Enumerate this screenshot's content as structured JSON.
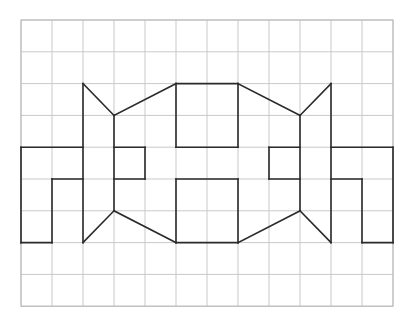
{
  "diagram": {
    "type": "grid-figure",
    "grid": {
      "columns": 12,
      "rows": 9,
      "origin_px": [
        21,
        20
      ],
      "cell_px": [
        31,
        31.8
      ],
      "line_color": "#c9c9c9"
    },
    "figure": {
      "stroke_color": "#2a2a2a",
      "segments": [
        [
          [
            0,
            4
          ],
          [
            2,
            4
          ]
        ],
        [
          [
            0,
            4
          ],
          [
            0,
            7
          ]
        ],
        [
          [
            0,
            7
          ],
          [
            1,
            7
          ]
        ],
        [
          [
            1,
            7
          ],
          [
            1,
            5
          ]
        ],
        [
          [
            1,
            5
          ],
          [
            2,
            5
          ]
        ],
        [
          [
            2,
            2
          ],
          [
            2,
            7
          ]
        ],
        [
          [
            2,
            2
          ],
          [
            3,
            3
          ]
        ],
        [
          [
            3,
            3
          ],
          [
            3,
            6
          ]
        ],
        [
          [
            3,
            6
          ],
          [
            2,
            7
          ]
        ],
        [
          [
            3,
            4
          ],
          [
            4,
            4
          ]
        ],
        [
          [
            4,
            4
          ],
          [
            4,
            5
          ]
        ],
        [
          [
            4,
            5
          ],
          [
            3,
            5
          ]
        ],
        [
          [
            3,
            3
          ],
          [
            5,
            2
          ]
        ],
        [
          [
            5,
            2
          ],
          [
            7,
            2
          ]
        ],
        [
          [
            7,
            2
          ],
          [
            9,
            3
          ]
        ],
        [
          [
            5,
            2
          ],
          [
            5,
            4
          ]
        ],
        [
          [
            5,
            4
          ],
          [
            7,
            4
          ]
        ],
        [
          [
            7,
            4
          ],
          [
            7,
            2
          ]
        ],
        [
          [
            3,
            6
          ],
          [
            5,
            7
          ]
        ],
        [
          [
            5,
            7
          ],
          [
            7,
            7
          ]
        ],
        [
          [
            7,
            7
          ],
          [
            9,
            6
          ]
        ],
        [
          [
            5,
            5
          ],
          [
            7,
            5
          ]
        ],
        [
          [
            5,
            5
          ],
          [
            5,
            7
          ]
        ],
        [
          [
            7,
            5
          ],
          [
            7,
            7
          ]
        ],
        [
          [
            9,
            4
          ],
          [
            8,
            4
          ]
        ],
        [
          [
            8,
            4
          ],
          [
            8,
            5
          ]
        ],
        [
          [
            8,
            5
          ],
          [
            9,
            5
          ]
        ],
        [
          [
            10,
            2
          ],
          [
            10,
            7
          ]
        ],
        [
          [
            10,
            2
          ],
          [
            9,
            3
          ]
        ],
        [
          [
            9,
            3
          ],
          [
            9,
            6
          ]
        ],
        [
          [
            9,
            6
          ],
          [
            10,
            7
          ]
        ],
        [
          [
            10,
            4
          ],
          [
            12,
            4
          ]
        ],
        [
          [
            12,
            4
          ],
          [
            12,
            7
          ]
        ],
        [
          [
            12,
            7
          ],
          [
            11,
            7
          ]
        ],
        [
          [
            11,
            7
          ],
          [
            11,
            5
          ]
        ],
        [
          [
            11,
            5
          ],
          [
            10,
            5
          ]
        ]
      ]
    }
  }
}
